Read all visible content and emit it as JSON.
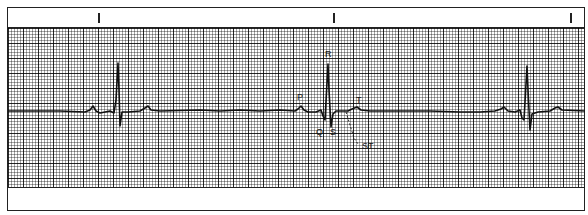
{
  "strip": {
    "type": "ECG rhythm strip",
    "paper": "standard ECG grid, small squares ~3px, large squares ~15px",
    "time_markers_x": [
      98,
      333,
      570
    ],
    "baseline_y": 111,
    "beats": [
      {
        "index": 1,
        "r_peak": {
          "x": 118,
          "y": 63
        },
        "s": {
          "x": 120,
          "y": 126
        },
        "p": {
          "x": 93,
          "y": 106
        },
        "t": {
          "x": 148,
          "y": 106
        }
      },
      {
        "index": 2,
        "r_peak": {
          "x": 328,
          "y": 64
        },
        "s": {
          "x": 331,
          "y": 127
        },
        "p": {
          "x": 301,
          "y": 106
        },
        "t": {
          "x": 357,
          "y": 107
        }
      },
      {
        "index": 3,
        "r_peak": {
          "x": 527,
          "y": 66
        },
        "s": {
          "x": 530,
          "y": 130
        },
        "p": {
          "x": 504,
          "y": 107
        },
        "t": {
          "x": 558,
          "y": 107
        }
      }
    ]
  },
  "labels": {
    "p": "P",
    "r": "R",
    "q": "Q",
    "s": "S",
    "t": "T",
    "st": "ST"
  },
  "colors": {
    "trace": "#111111",
    "grid_major": "#3a3a3a",
    "grid_minor": "#8a8a8a",
    "paper": "#ffffff"
  }
}
